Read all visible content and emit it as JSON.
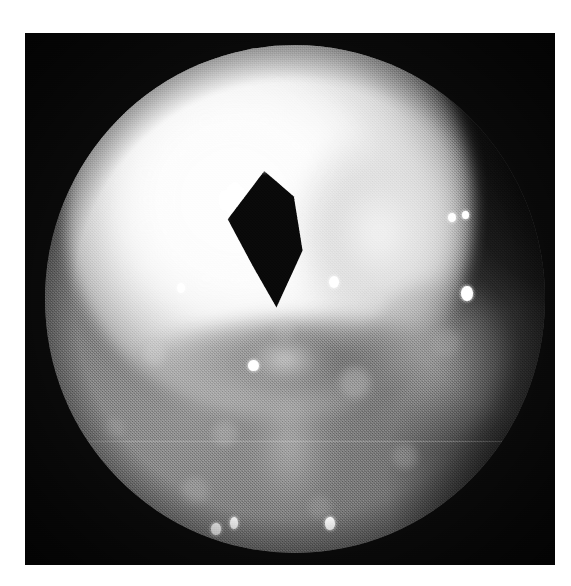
{
  "figure": {
    "kind": "endoscopic-photograph",
    "modality": "endoscopy",
    "color_mode": "grayscale",
    "orientation": "portrait",
    "caption": "",
    "page_background": "#ffffff",
    "plate": {
      "x": 25,
      "y": 33,
      "width": 530,
      "height": 532,
      "background": "#0b0b0b",
      "border_color": "#000000"
    },
    "field_of_view": {
      "shape": "circle",
      "x": 45,
      "y": 45,
      "width": 500,
      "height": 508,
      "vignette": true
    }
  },
  "palette": {
    "paper_white": "#ffffff",
    "plate_black": "#0b0b0b",
    "lumen_black": "#080808",
    "mucosa_mid": "#6c6c6c",
    "mucosa_dark": "#2b2b2b",
    "mucosa_light": "#8e8e8e",
    "highlight_white": "#ffffff",
    "bright_mound": "#fbfbfb"
  },
  "regions": [
    {
      "name": "bright-mound",
      "label": "overexposed pale mucosal mound",
      "tone": "very-bright"
    },
    {
      "name": "lumen-opening",
      "label": "dark triangular lumen opening",
      "tone": "black"
    },
    {
      "name": "bright-ridge-right",
      "label": "pale ridge right of lumen",
      "tone": "bright"
    },
    {
      "name": "fold-shadow",
      "label": "shadowed fold beneath mound",
      "tone": "dark"
    },
    {
      "name": "mid-bump",
      "label": "small pale bump below lumen",
      "tone": "mid-bright"
    },
    {
      "name": "right-mass",
      "label": "granular raised tissue at right",
      "tone": "mid"
    },
    {
      "name": "lower-streak",
      "label": "pale streak to lower centre",
      "tone": "mid-bright"
    },
    {
      "name": "tissue-mottle",
      "label": "mottled mucosal texture",
      "tone": "mid"
    }
  ],
  "specular_highlights": [
    {
      "id": 1,
      "x": 26.4,
      "y": 46.8,
      "w": 1.5,
      "h": 2.0
    },
    {
      "id": 2,
      "x": 40.6,
      "y": 62.0,
      "w": 2.1,
      "h": 2.2
    },
    {
      "id": 3,
      "x": 56.8,
      "y": 45.5,
      "w": 2.0,
      "h": 2.4
    },
    {
      "id": 4,
      "x": 80.5,
      "y": 33.0,
      "w": 1.6,
      "h": 1.8
    },
    {
      "id": 5,
      "x": 83.4,
      "y": 32.6,
      "w": 1.3,
      "h": 1.6
    },
    {
      "id": 6,
      "x": 83.2,
      "y": 47.4,
      "w": 2.3,
      "h": 3.0
    },
    {
      "id": 7,
      "x": 33.2,
      "y": 94.0,
      "w": 1.9,
      "h": 2.4
    },
    {
      "id": 8,
      "x": 37.0,
      "y": 92.9,
      "w": 1.6,
      "h": 2.3
    },
    {
      "id": 9,
      "x": 56.0,
      "y": 92.9,
      "w": 1.9,
      "h": 2.5
    }
  ],
  "artifacts": {
    "scanline": {
      "present": true,
      "y_percent": 78,
      "color": "rgba(255,255,255,.22)"
    },
    "print_grain": {
      "present": true,
      "opacity": 0.3
    }
  }
}
